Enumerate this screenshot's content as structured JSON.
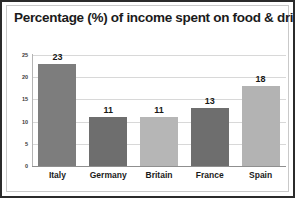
{
  "chart_data": {
    "type": "bar",
    "title": "Percentage (%) of income spent on food & drink",
    "categories": [
      "Italy",
      "Germany",
      "Britain",
      "France",
      "Spain"
    ],
    "values": [
      23,
      11,
      11,
      13,
      18
    ],
    "value_labels": [
      "23",
      "11",
      "11",
      "13",
      "18"
    ],
    "bar_colors": [
      "#7d7d7d",
      "#6e6e6e",
      "#b6b6b6",
      "#6e6e6e",
      "#b3b3b3"
    ],
    "xlabel": "",
    "ylabel": "",
    "ylim": [
      0,
      25
    ],
    "yticks": [
      25,
      20,
      15,
      10,
      5,
      0
    ],
    "ytick_labels": [
      "25",
      "20",
      "15",
      "10",
      "5",
      "0"
    ],
    "grid": true,
    "legend": false,
    "series": [
      {
        "name": "Percentage of income spent on food & drink",
        "values": [
          23,
          11,
          11,
          13,
          18
        ]
      }
    ]
  },
  "style": {
    "background": "#ffffff",
    "border_color": "#2b2b2b",
    "gridline_color": "#d8d8d8",
    "axis_color": "#8f8f8f",
    "text_color": "#1b1b1b"
  }
}
